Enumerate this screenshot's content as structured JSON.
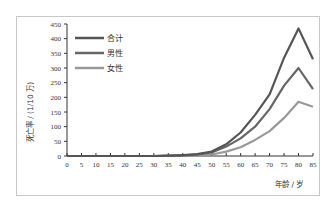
{
  "chart_data": {
    "type": "line",
    "title": "",
    "xlabel": "年龄 / 岁",
    "ylabel": "死亡率 / (1/10 万)",
    "x": [
      0,
      5,
      10,
      15,
      20,
      25,
      30,
      35,
      40,
      45,
      50,
      55,
      60,
      65,
      70,
      75,
      80,
      85
    ],
    "xlim": [
      0,
      85
    ],
    "ylim": [
      0,
      450
    ],
    "yticks": [
      0,
      50,
      100,
      150,
      200,
      250,
      300,
      350,
      400,
      450
    ],
    "grid": false,
    "legend_position": "upper-left",
    "series": [
      {
        "name": "合计",
        "color": "#555555",
        "values": [
          0,
          0,
          0,
          0,
          0,
          0,
          0,
          1,
          3,
          6,
          15,
          40,
          80,
          140,
          210,
          335,
          435,
          330
        ]
      },
      {
        "name": "男性",
        "color": "#666666",
        "values": [
          0,
          0,
          0,
          0,
          0,
          0,
          0,
          1,
          2,
          5,
          12,
          32,
          60,
          100,
          160,
          240,
          300,
          228
        ]
      },
      {
        "name": "女性",
        "color": "#999999",
        "values": [
          0,
          0,
          0,
          0,
          0,
          0,
          0,
          0,
          1,
          2,
          5,
          15,
          30,
          55,
          85,
          130,
          185,
          168
        ]
      }
    ]
  },
  "axes": {
    "x_label": "年龄 / 岁",
    "y_label": "死亡率 / (1/10 万)"
  },
  "legend": {
    "items": [
      {
        "label": "合计",
        "color": "#555555"
      },
      {
        "label": "男性",
        "color": "#666666"
      },
      {
        "label": "女性",
        "color": "#999999"
      }
    ]
  }
}
